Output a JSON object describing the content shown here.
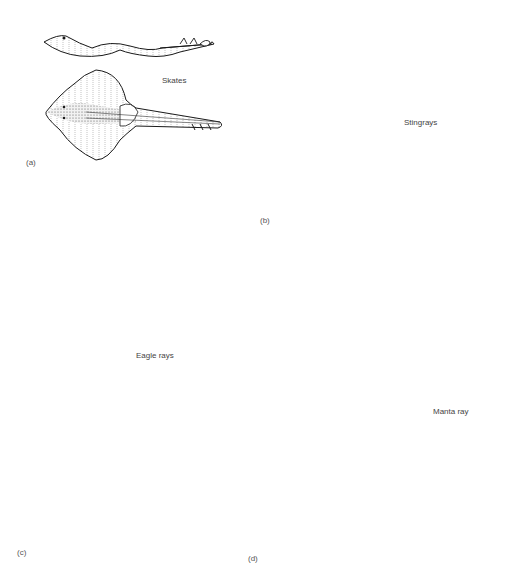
{
  "figure": {
    "panels": [
      {
        "id": "a",
        "letter": "(a)",
        "name": "Skates"
      },
      {
        "id": "b",
        "letter": "(b)",
        "name": "Stingrays"
      },
      {
        "id": "c",
        "letter": "(c)",
        "name": "Eagle rays"
      },
      {
        "id": "d",
        "letter": "(d)",
        "name": "Manta ray"
      }
    ]
  },
  "colors": {
    "ink": "#1a1a1a",
    "stipple_light": "#e6e6e6",
    "stipple_mid": "#c8c8c8",
    "stipple_dark": "#8a8a8a"
  }
}
